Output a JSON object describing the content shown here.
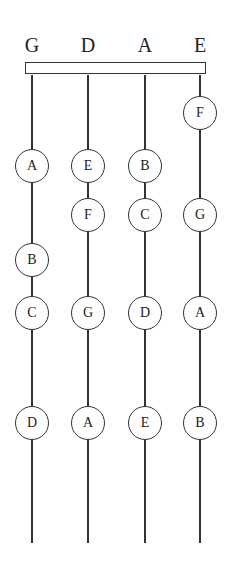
{
  "strings": [
    {
      "label": "G",
      "x": 32
    },
    {
      "label": "D",
      "x": 88
    },
    {
      "label": "A",
      "x": 145
    },
    {
      "label": "E",
      "x": 200
    }
  ],
  "notes": [
    {
      "string": 3,
      "y": 113,
      "label": "F"
    },
    {
      "string": 0,
      "y": 166,
      "label": "A"
    },
    {
      "string": 1,
      "y": 166,
      "label": "E"
    },
    {
      "string": 2,
      "y": 166,
      "label": "B"
    },
    {
      "string": 1,
      "y": 215,
      "label": "F"
    },
    {
      "string": 2,
      "y": 215,
      "label": "C"
    },
    {
      "string": 3,
      "y": 215,
      "label": "G"
    },
    {
      "string": 0,
      "y": 260,
      "label": "B"
    },
    {
      "string": 0,
      "y": 313,
      "label": "C"
    },
    {
      "string": 1,
      "y": 313,
      "label": "G"
    },
    {
      "string": 2,
      "y": 313,
      "label": "D"
    },
    {
      "string": 3,
      "y": 313,
      "label": "A"
    },
    {
      "string": 0,
      "y": 423,
      "label": "D"
    },
    {
      "string": 1,
      "y": 423,
      "label": "A"
    },
    {
      "string": 2,
      "y": 423,
      "label": "E"
    },
    {
      "string": 3,
      "y": 423,
      "label": "B"
    }
  ]
}
